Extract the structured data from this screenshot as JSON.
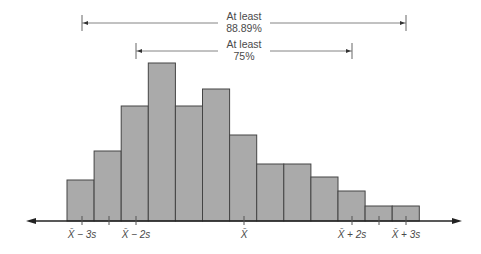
{
  "chart_data": {
    "type": "bar",
    "title": "",
    "xlabel": "",
    "ylabel": "",
    "grid": false,
    "legend": null,
    "bins": 13,
    "categories": [
      "1",
      "2",
      "3",
      "4",
      "5",
      "6",
      "7",
      "8",
      "9",
      "10",
      "11",
      "12",
      "13"
    ],
    "values": [
      41,
      70,
      115,
      158,
      115,
      132,
      86,
      57,
      57,
      44,
      30,
      15,
      15
    ],
    "tick_labels": [
      {
        "pos": -3,
        "text": "X̄ − 3s"
      },
      {
        "pos": -2.5,
        "text": ""
      },
      {
        "pos": -2,
        "text": "X̄ − 2s"
      },
      {
        "pos": 0,
        "text": "X̄"
      },
      {
        "pos": 2,
        "text": "X̄ + 2s"
      },
      {
        "pos": 2.5,
        "text": ""
      },
      {
        "pos": 3,
        "text": "X̄ + 3s"
      }
    ],
    "annotations": [
      {
        "from": -3,
        "to": 3,
        "line1": "At least",
        "line2": "88.89%"
      },
      {
        "from": -2,
        "to": 2,
        "line1": "At least",
        "line2": "75%"
      }
    ]
  },
  "colors": {
    "bar_fill": "#aaaaaa",
    "bar_stroke": "#444444",
    "axis": "#222222",
    "text": "#4a4a4a",
    "bracket": "#666666"
  }
}
